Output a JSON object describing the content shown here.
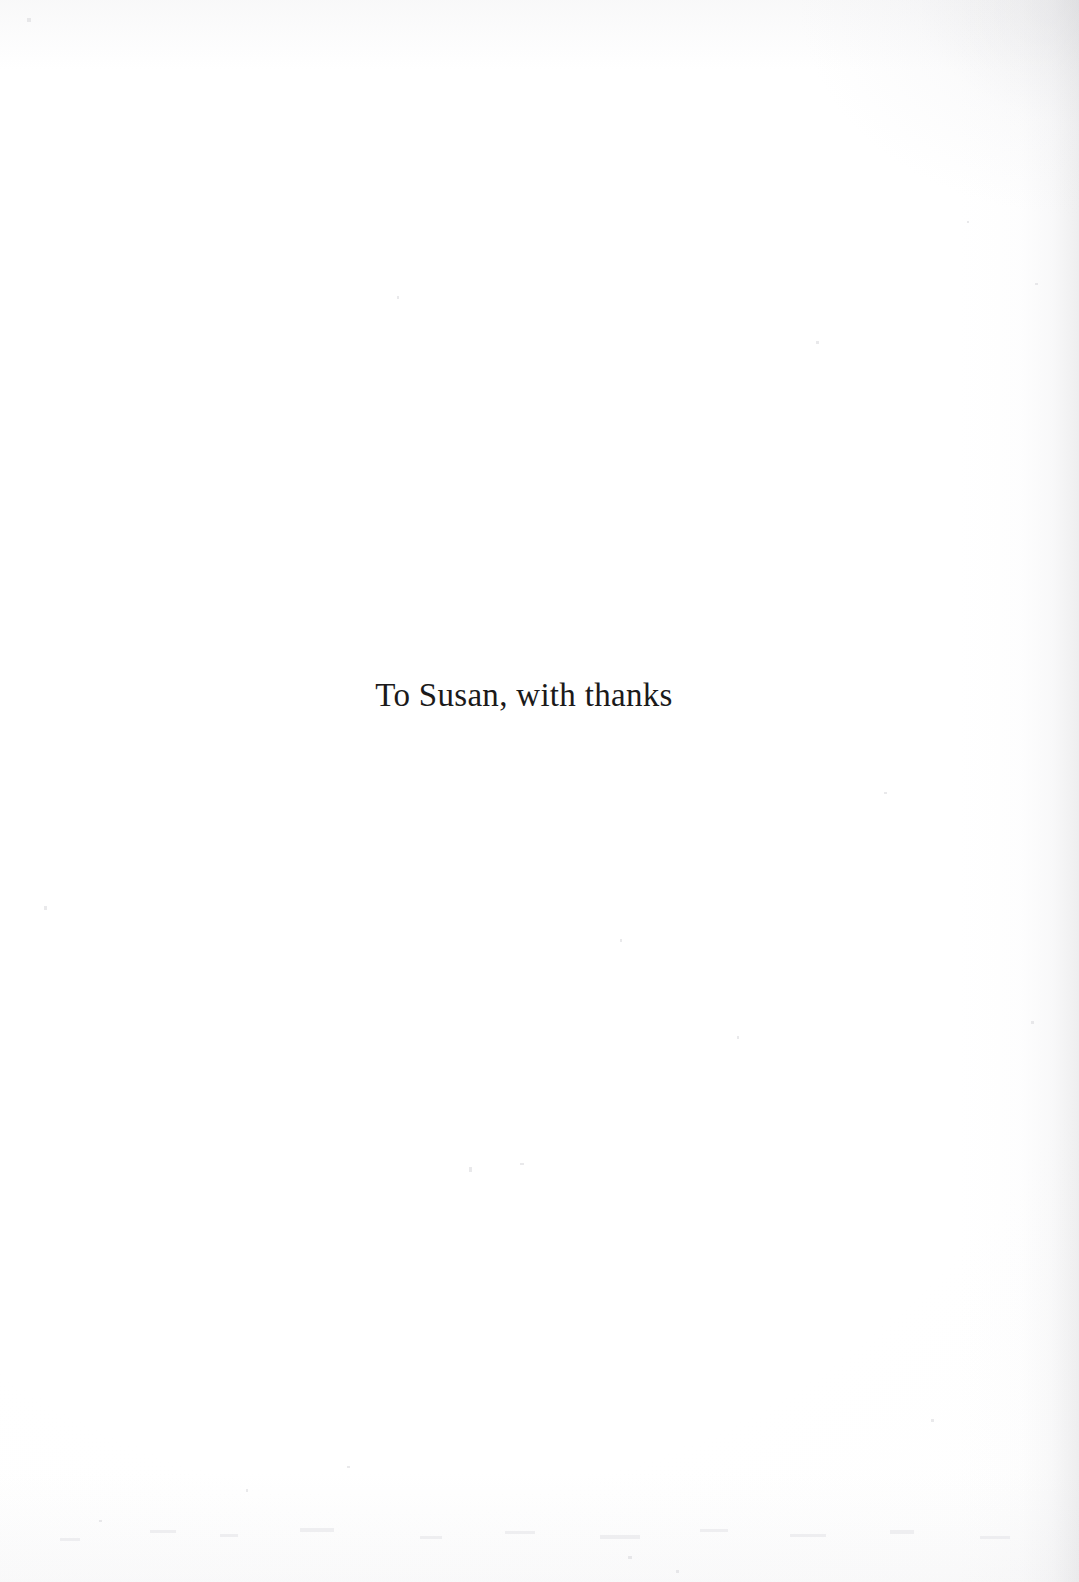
{
  "document": {
    "page_type": "dedication",
    "background_color": "#fefefe",
    "ink_color": "#1b1a1a"
  },
  "dedication": {
    "text": "To Susan, with thanks"
  },
  "artifacts": {
    "vignette_color": "#cdcdd0",
    "speckle_color": "#d8d8dc"
  }
}
